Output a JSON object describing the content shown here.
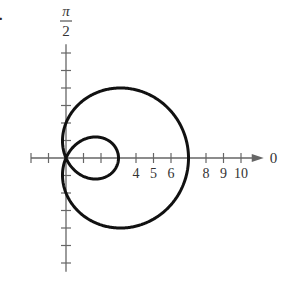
{
  "problem_number": "3.",
  "chart_data": {
    "type": "line",
    "title": "",
    "coordinate_system": "polar",
    "equation_hint": "limaçon with inner loop, r = 2 + 5cos(theta)",
    "xlabel": "0",
    "ylabel": "π/2",
    "ylabel_num": "π",
    "ylabel_den": "2",
    "x_tick_labels": [
      "4",
      "5",
      "6",
      "8",
      "9",
      "10"
    ],
    "x_ticks": [
      -2,
      -1,
      1,
      2,
      3,
      4,
      5,
      6,
      7,
      8,
      9,
      10
    ],
    "y_ticks": [
      -6,
      -5,
      -4,
      -3,
      -2,
      -1,
      1,
      2,
      3,
      4,
      5,
      6
    ],
    "xlim": [
      -2,
      10.5
    ],
    "ylim": [
      -6.5,
      6.5
    ],
    "key_points": {
      "outer_loop_x_intercept": 7,
      "inner_loop_x_intercept": 3,
      "y_intercepts": [
        2,
        -2
      ],
      "max_y": 4.0
    },
    "grid": false,
    "legend": null
  },
  "layout": {
    "origin_px": [
      66,
      158
    ],
    "unit_px": 17.5
  }
}
